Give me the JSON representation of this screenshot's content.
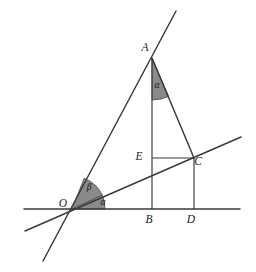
{
  "figure": {
    "background_color": "#ffffff",
    "line_color": "#3a3a3a",
    "shade_color": "#8a8a8a",
    "label_color": "#1c1c1c"
  },
  "points": {
    "A": {
      "label": "A",
      "x": 152,
      "y": 58,
      "label_x": 145,
      "label_y": 51
    },
    "B": {
      "label": "B",
      "x": 152,
      "y": 209,
      "label_x": 149,
      "label_y": 223
    },
    "C": {
      "label": "C",
      "x": 194,
      "y": 158,
      "label_x": 198,
      "label_y": 165
    },
    "D": {
      "label": "D",
      "x": 194,
      "y": 209,
      "label_x": 191,
      "label_y": 223
    },
    "E": {
      "label": "E",
      "x": 152,
      "y": 158,
      "label_x": 139,
      "label_y": 160
    },
    "O": {
      "label": "O",
      "x": 72,
      "y": 209,
      "label_x": 63,
      "label_y": 207
    }
  },
  "angles": [
    {
      "name": "alpha-at-O",
      "label": "α",
      "vertex": "O",
      "label_x": 103,
      "label_y": 205,
      "radius": 33,
      "shaded": true
    },
    {
      "name": "beta-at-O",
      "label": "β",
      "vertex": "O",
      "label_x": 89,
      "label_y": 190,
      "radius": 33,
      "shaded": true
    },
    {
      "name": "alpha-at-A",
      "label": "α",
      "vertex": "A",
      "label_x": 157,
      "label_y": 88,
      "radius": 42,
      "shaded": true
    }
  ],
  "segments": [
    {
      "name": "baseline-horizontal",
      "from": [
        24,
        209
      ],
      "to": [
        240,
        209
      ]
    },
    {
      "name": "line-OA-extended",
      "from": [
        43,
        261
      ],
      "to": [
        176,
        11
      ]
    },
    {
      "name": "line-OC-extended",
      "from": [
        25,
        231
      ],
      "to": [
        241,
        137
      ]
    },
    {
      "name": "segment-AB",
      "from": [
        152,
        58
      ],
      "to": [
        152,
        209
      ]
    },
    {
      "name": "segment-AC",
      "from": [
        152,
        58
      ],
      "to": [
        194,
        158
      ]
    },
    {
      "name": "segment-EC",
      "from": [
        152,
        158
      ],
      "to": [
        194,
        158
      ]
    },
    {
      "name": "segment-CD",
      "from": [
        194,
        158
      ],
      "to": [
        194,
        209
      ]
    }
  ],
  "wedge_paths": {
    "alpha-at-O": "M 72 209 L 105 209 A 33 33 0 0 0 102.3 195.1 Z",
    "beta-at-O": "M 72 209 L 102.3 195.1 A 33 33 0 0 0 84.1 178.3 Z",
    "alpha-at-A": "M 152 58 L 152 100 A 42 42 0 0 0 168.6 96.4 Z"
  }
}
